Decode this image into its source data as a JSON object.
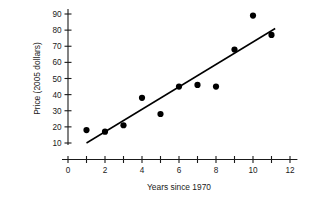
{
  "chart_data": {
    "type": "scatter",
    "title": "",
    "xlabel": "Years since 1970",
    "ylabel": "Price (2005 dollars)",
    "xlim": [
      0,
      12.4
    ],
    "ylim": [
      5,
      94
    ],
    "grid": false,
    "legend": null,
    "x_ticks_major": [
      0,
      2,
      4,
      6,
      8,
      10,
      12
    ],
    "x_ticks_minor": [
      1,
      3,
      5,
      7,
      9,
      11
    ],
    "x_tick_labels": [
      "0",
      "2",
      "4",
      "6",
      "8",
      "10",
      "12"
    ],
    "y_ticks": [
      10,
      20,
      30,
      40,
      50,
      60,
      70,
      80,
      90
    ],
    "y_tick_labels": [
      "10",
      "20",
      "30",
      "40",
      "50",
      "60",
      "70",
      "80",
      "90"
    ],
    "points": [
      {
        "x": 1,
        "y": 18
      },
      {
        "x": 2,
        "y": 17
      },
      {
        "x": 3,
        "y": 21
      },
      {
        "x": 4,
        "y": 38
      },
      {
        "x": 5,
        "y": 28
      },
      {
        "x": 6,
        "y": 45
      },
      {
        "x": 7,
        "y": 46
      },
      {
        "x": 8,
        "y": 45
      },
      {
        "x": 9,
        "y": 68
      },
      {
        "x": 10,
        "y": 89
      },
      {
        "x": 11,
        "y": 77
      }
    ],
    "trend_line": {
      "type": "line",
      "x_start": 1.0,
      "y_start": 10.0,
      "x_end": 11.2,
      "y_end": 81.0
    },
    "colors": {
      "point": "#000000",
      "line": "#000000",
      "axis": "#1a1a1a",
      "background": "#ffffff"
    }
  }
}
